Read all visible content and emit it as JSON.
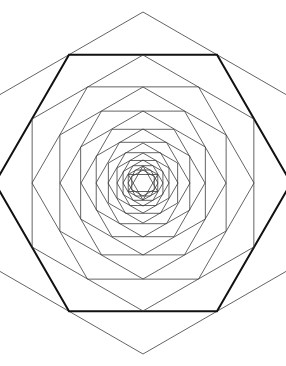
{
  "figure": {
    "kind": "geometric-line-drawing",
    "background_color": "#ffffff",
    "canvas": {
      "width": 286,
      "height": 366
    },
    "center": {
      "x": 143,
      "y": 183
    }
  },
  "style": {
    "default_stroke_color": "#3c3c3c",
    "emphasis_stroke_color": "#111111",
    "light_stroke_color": "#555555",
    "default_stroke_width": 0.8,
    "emphasis_stroke_width": 2.0
  },
  "chart_data": {
    "type": "line",
    "xlabel": "",
    "ylabel": "",
    "grid": false,
    "legend": "none",
    "xlim": [
      0,
      286
    ],
    "ylim": [
      0,
      366
    ],
    "center": [
      143,
      183
    ],
    "rotation_step_degrees": 30,
    "scale_step": 0.866,
    "ring_count": 14,
    "rings": [
      {
        "index": 0,
        "radius": 171,
        "rotation_degrees": 90,
        "orientation": "pointy-top",
        "stroke": "#3c3c3c",
        "width": 0.8
      },
      {
        "index": 1,
        "radius": 148,
        "rotation_degrees": 60,
        "orientation": "flat-top",
        "stroke": "#111111",
        "width": 2.0
      },
      {
        "index": 2,
        "radius": 128,
        "rotation_degrees": 30,
        "orientation": "pointy-top",
        "stroke": "#3c3c3c",
        "width": 0.8
      },
      {
        "index": 3,
        "radius": 111,
        "rotation_degrees": 0,
        "orientation": "flat-top",
        "stroke": "#3c3c3c",
        "width": 0.8
      },
      {
        "index": 4,
        "radius": 96,
        "rotation_degrees": 30,
        "orientation": "pointy-top",
        "stroke": "#3c3c3c",
        "width": 0.8
      },
      {
        "index": 5,
        "radius": 83,
        "rotation_degrees": 60,
        "orientation": "flat-top",
        "stroke": "#3c3c3c",
        "width": 0.8
      },
      {
        "index": 6,
        "radius": 72,
        "rotation_degrees": 90,
        "orientation": "pointy-top",
        "stroke": "#3c3c3c",
        "width": 0.8
      },
      {
        "index": 7,
        "radius": 62,
        "rotation_degrees": 0,
        "orientation": "flat-top",
        "stroke": "#3c3c3c",
        "width": 0.8
      },
      {
        "index": 8,
        "radius": 54,
        "rotation_degrees": 30,
        "orientation": "pointy-top",
        "stroke": "#3c3c3c",
        "width": 0.8
      },
      {
        "index": 9,
        "radius": 47,
        "rotation_degrees": 60,
        "orientation": "flat-top",
        "stroke": "#3c3c3c",
        "width": 0.8
      },
      {
        "index": 10,
        "radius": 40,
        "rotation_degrees": 90,
        "orientation": "pointy-top",
        "stroke": "#3c3c3c",
        "width": 0.8
      },
      {
        "index": 11,
        "radius": 35,
        "rotation_degrees": 0,
        "orientation": "flat-top",
        "stroke": "#3c3c3c",
        "width": 0.8
      },
      {
        "index": 12,
        "radius": 30,
        "rotation_degrees": 30,
        "orientation": "pointy-top",
        "stroke": "#3c3c3c",
        "width": 0.8
      },
      {
        "index": 13,
        "radius": 26,
        "rotation_degrees": 60,
        "orientation": "flat-top",
        "stroke": "#3c3c3c",
        "width": 0.8
      },
      {
        "index": 14,
        "radius": 23,
        "rotation_degrees": 90,
        "orientation": "pointy-top",
        "stroke": "#3c3c3c",
        "width": 0.8
      },
      {
        "index": 15,
        "radius": 20,
        "rotation_degrees": 0,
        "orientation": "flat-top",
        "stroke": "#3c3c3c",
        "width": 0.8
      },
      {
        "index": 16,
        "radius": 17,
        "rotation_degrees": 30,
        "orientation": "pointy-top",
        "stroke": "#3c3c3c",
        "width": 0.8
      },
      {
        "index": 17,
        "radius": 15,
        "rotation_degrees": 60,
        "orientation": "flat-top",
        "stroke": "#3c3c3c",
        "width": 0.8
      },
      {
        "index": 18,
        "radius": 13,
        "rotation_degrees": 90,
        "orientation": "pointy-top",
        "stroke": "#3c3c3c",
        "width": 0.8
      }
    ],
    "center_star": {
      "type": "hexagram",
      "radius": 17,
      "rotation_degrees": 30,
      "stroke": "#3c3c3c",
      "width": 0.8
    }
  }
}
